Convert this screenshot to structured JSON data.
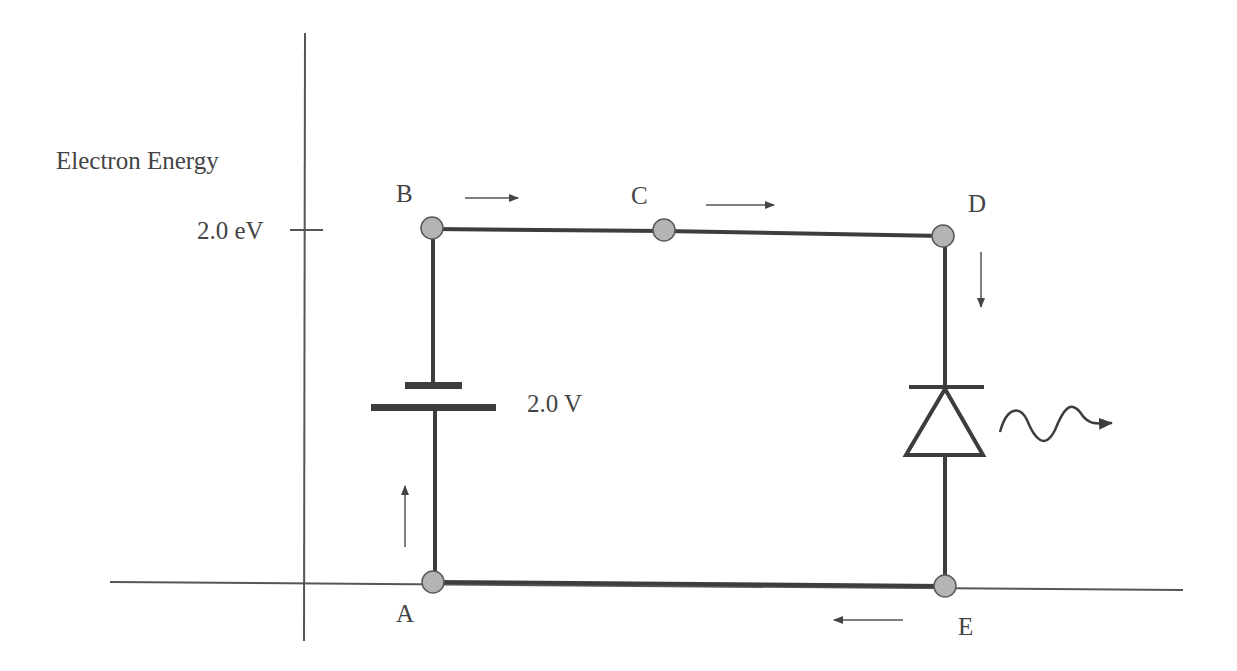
{
  "diagram": {
    "axis": {
      "y_label": "Electron Energy",
      "tick_label": "2.0 eV"
    },
    "nodes": [
      {
        "id": "A",
        "label": "A"
      },
      {
        "id": "B",
        "label": "B"
      },
      {
        "id": "C",
        "label": "C"
      },
      {
        "id": "D",
        "label": "D"
      },
      {
        "id": "E",
        "label": "E"
      }
    ],
    "battery": {
      "label": "2.0 V"
    },
    "components": {
      "source": "battery",
      "load": "light-emitting diode",
      "emission": "photon (wavy arrow)"
    },
    "current_arrows": [
      {
        "segment": "A-B",
        "direction": "up"
      },
      {
        "segment": "B-C",
        "direction": "right"
      },
      {
        "segment": "C-D",
        "direction": "right"
      },
      {
        "segment": "D-E",
        "direction": "down"
      },
      {
        "segment": "E-A",
        "direction": "left"
      }
    ],
    "colors": {
      "wire": "#3d3d3d",
      "axis": "#555555",
      "node_fill": "#b4b4b4",
      "node_stroke": "#5a5a5a",
      "text": "#444444"
    }
  }
}
